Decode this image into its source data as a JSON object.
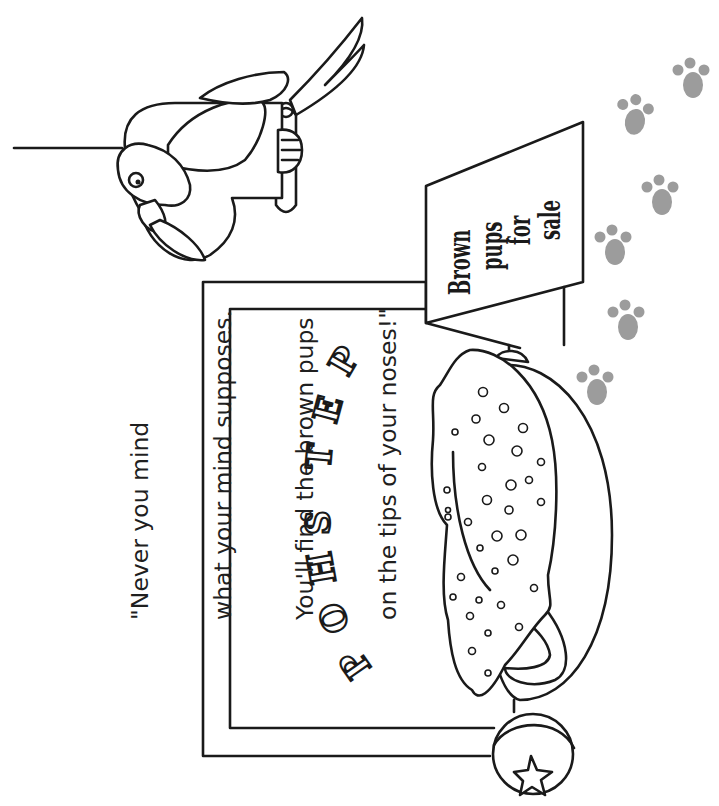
{
  "illustration": {
    "type": "coloring-page",
    "orientation": "rotated-90-ccw"
  },
  "quote": {
    "lines": [
      "\"Never you mind",
      "what your mind supposes.",
      "You'll find the brown pups",
      "on the tips of your noses!\""
    ]
  },
  "shop": {
    "name_letters": [
      "P",
      "E",
      "T",
      "S",
      "H",
      "O",
      "P"
    ],
    "name": "PET SHOP"
  },
  "sign": {
    "lines": [
      "Brown",
      "pups",
      "for",
      "sale"
    ]
  },
  "objects": {
    "parrot": "parrot-on-perch",
    "basket": "dog-basket-with-spotted-blanket",
    "ball": "ball-with-star",
    "paw_prints_count": 6
  },
  "colors": {
    "line": "#1a1a1a",
    "paw": "#9c9c9c",
    "background": "#ffffff"
  }
}
